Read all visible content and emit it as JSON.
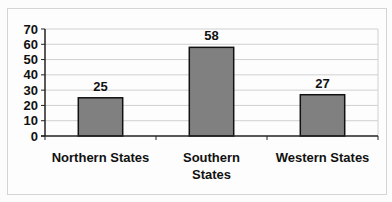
{
  "chart_data": {
    "type": "bar",
    "title": "",
    "xlabel": "",
    "ylabel": "",
    "categories": [
      "Northern States",
      "Southern States",
      "Western States"
    ],
    "category_lines": [
      [
        "Northern States"
      ],
      [
        "Southern",
        "States"
      ],
      [
        "Western States"
      ]
    ],
    "values": [
      25,
      58,
      27
    ],
    "data_labels": [
      "25",
      "58",
      "27"
    ],
    "ylim": [
      0,
      70
    ],
    "yticks": [
      0,
      10,
      20,
      30,
      40,
      50,
      60,
      70
    ],
    "grid": true,
    "legend": "none",
    "colors": {
      "bar": "#808080",
      "bar_edge": "#111111",
      "grid": "#d0d0d0",
      "axis": "#222222"
    }
  }
}
